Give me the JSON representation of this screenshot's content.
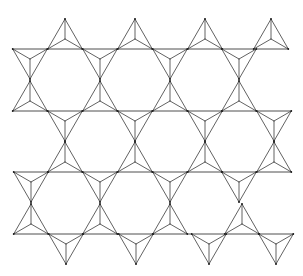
{
  "diagram": {
    "title": "",
    "stroke_color": "#3a3a3a",
    "background": "#ffffff",
    "triangle_half_width": 17.3,
    "triangle_height": 30,
    "rows": [
      {
        "baseline_y": 49,
        "start": "down",
        "centers_x": [
          30,
          65,
          100,
          135,
          170,
          205,
          239,
          271
        ]
      },
      {
        "baseline_y": 111,
        "start": "up",
        "centers_x": [
          30,
          65,
          100,
          135,
          170,
          205,
          239,
          274
        ]
      },
      {
        "baseline_y": 172,
        "start": "down",
        "centers_x": [
          31,
          65,
          100,
          135,
          170,
          205,
          239,
          274
        ]
      },
      {
        "baseline_y": 234,
        "start": "up",
        "centers_x": [
          31,
          66,
          100,
          136,
          170,
          209,
          242,
          276
        ]
      }
    ]
  }
}
